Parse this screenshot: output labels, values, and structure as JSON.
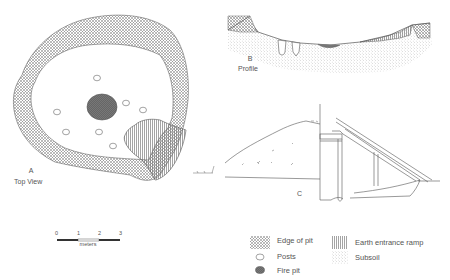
{
  "panels": {
    "top_view": {
      "letter": "A",
      "title": "Top View"
    },
    "profile": {
      "letter": "B",
      "title": "Profile"
    },
    "section": {
      "letter": "C"
    }
  },
  "scale_bar": {
    "ticks": [
      "0",
      "1",
      "2",
      "3"
    ],
    "unit": "meters"
  },
  "legend": {
    "items": [
      {
        "key": "edge_of_pit",
        "label": "Edge of pit",
        "pattern": "crosshatch"
      },
      {
        "key": "posts",
        "label": "Posts",
        "pattern": "open-oval"
      },
      {
        "key": "fire_pit",
        "label": "Fire pit",
        "pattern": "dark-oval"
      },
      {
        "key": "earth_entrance_ramp",
        "label": "Earth entrance ramp",
        "pattern": "vertical-lines"
      },
      {
        "key": "subsoil",
        "label": "Subsoil",
        "pattern": "stipple"
      }
    ]
  },
  "colors": {
    "line": "#555555",
    "fire_pit": "#666666",
    "hatch": "#777777"
  }
}
